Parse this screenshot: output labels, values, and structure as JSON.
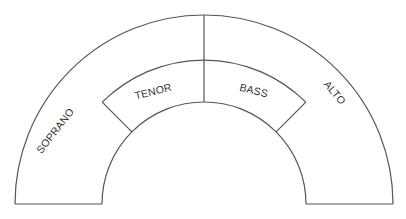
{
  "diagram": {
    "type": "choir-seating-chart",
    "sections": [
      {
        "id": "soprano",
        "label": "SOPRANO",
        "position": "outer-left"
      },
      {
        "id": "tenor",
        "label": "TENOR",
        "position": "inner-left"
      },
      {
        "id": "bass",
        "label": "BASS",
        "position": "inner-right"
      },
      {
        "id": "alto",
        "label": "ALTO",
        "position": "outer-right"
      }
    ],
    "colors": {
      "stroke": "#555555",
      "text": "#333333",
      "background": "#ffffff"
    }
  }
}
